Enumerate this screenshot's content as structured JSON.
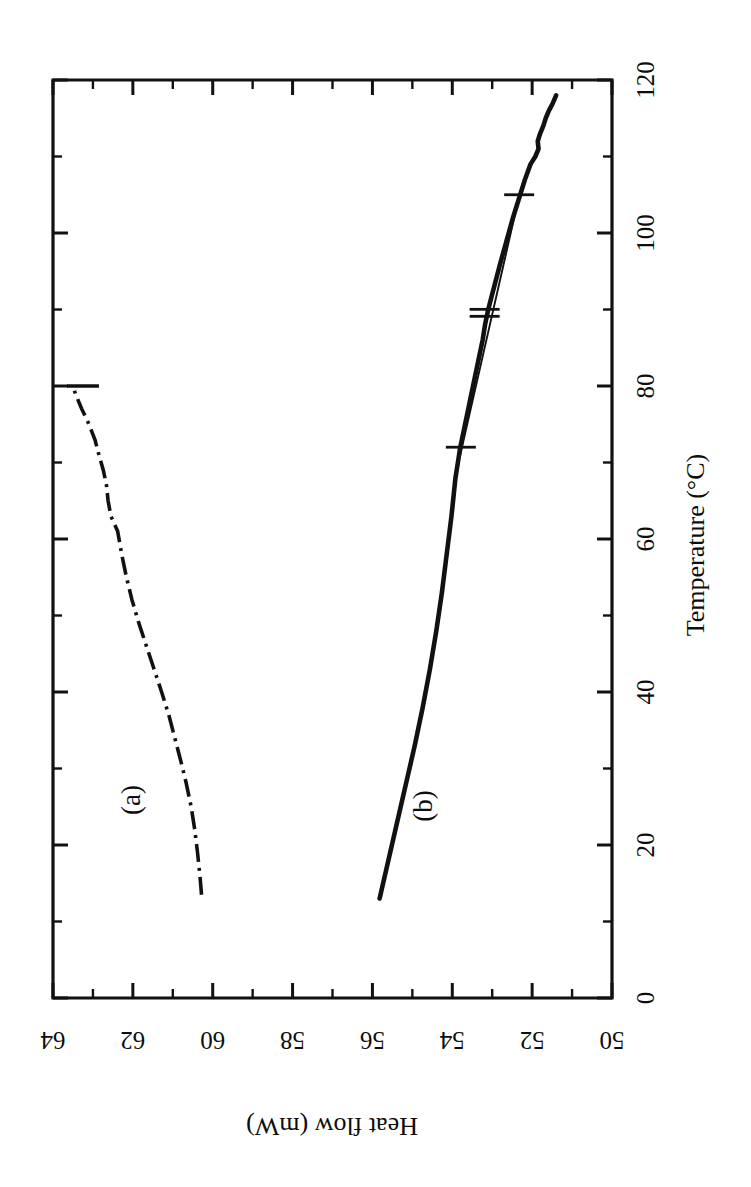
{
  "figure": {
    "kind": "dsc-thermogram",
    "orientation_note": "rotated",
    "background_color": "#ffffff",
    "ink_color": "#111111"
  },
  "chart_data": {
    "type": "line",
    "title": "",
    "subtitle": "",
    "xlabel": "Temperature (°C)",
    "ylabel": "Heat flow (mW)",
    "xlim": [
      0,
      120
    ],
    "ylim": [
      50,
      64
    ],
    "y_inverted": true,
    "grid": false,
    "legend": "inline-labels",
    "x_ticks": [
      0,
      20,
      40,
      60,
      80,
      100,
      120
    ],
    "x_tick_labels": [
      "0",
      "20",
      "40",
      "60",
      "80",
      "100",
      "120"
    ],
    "x_minor_step": 10,
    "y_ticks": [
      64,
      62,
      60,
      58,
      56,
      54,
      52,
      50
    ],
    "y_tick_labels": [
      "64",
      "62",
      "60",
      "58",
      "56",
      "54",
      "52",
      "50"
    ],
    "y_minor_step": 1,
    "annotations": [
      {
        "text": "(a)",
        "x": 24.0,
        "y": 61.8
      },
      {
        "text": "(b)",
        "x": 23.5,
        "y": 54.4
      }
    ],
    "series": [
      {
        "name": "(a)",
        "label": "(a)",
        "style": "dash-dot",
        "x": [
          13.5,
          16,
          19,
          22,
          25,
          28,
          31,
          34,
          37,
          40,
          43,
          46,
          49,
          52,
          55,
          58,
          61,
          63,
          65,
          67,
          69,
          71,
          73,
          75,
          77,
          79,
          80
        ],
        "y": [
          60.28,
          60.32,
          60.38,
          60.45,
          60.54,
          60.66,
          60.8,
          60.95,
          61.1,
          61.28,
          61.47,
          61.66,
          61.85,
          62.02,
          62.16,
          62.28,
          62.38,
          62.55,
          62.62,
          62.66,
          62.74,
          62.85,
          62.95,
          63.1,
          63.28,
          63.44,
          63.5
        ]
      },
      {
        "name": "(b)",
        "label": "(b)",
        "style": "solid",
        "x": [
          13.0,
          18,
          23,
          28,
          33,
          38,
          43,
          48,
          53,
          58,
          63,
          66,
          68,
          70,
          72,
          74,
          76,
          78,
          80,
          83,
          86,
          88,
          90,
          92,
          94,
          96,
          99,
          102,
          105,
          107,
          109,
          110,
          111,
          112,
          113,
          114,
          115,
          116,
          117,
          118
        ],
        "y": [
          55.82,
          55.6,
          55.38,
          55.16,
          54.94,
          54.74,
          54.56,
          54.4,
          54.26,
          54.14,
          54.02,
          53.96,
          53.92,
          53.86,
          53.8,
          53.72,
          53.64,
          53.56,
          53.48,
          53.36,
          53.24,
          53.18,
          53.1,
          53.0,
          52.9,
          52.8,
          52.64,
          52.48,
          52.3,
          52.18,
          52.04,
          51.92,
          51.84,
          51.86,
          51.8,
          51.72,
          51.66,
          51.58,
          51.48,
          51.4
        ]
      }
    ],
    "construction_lines": [
      {
        "name": "baseline-chord",
        "style": "thin-solid",
        "from": {
          "x": 71.0,
          "y": 53.8
        },
        "to": {
          "x": 104.5,
          "y": 52.34
        }
      }
    ],
    "markers": [
      {
        "name": "onset-marker",
        "x": 72.0,
        "y": 53.76,
        "style": "cross"
      },
      {
        "name": "mid-marker",
        "x": 89.5,
        "y": 53.14,
        "style": "double-cross"
      },
      {
        "name": "end-marker",
        "x": 105.0,
        "y": 52.3,
        "style": "cross"
      }
    ]
  },
  "axes": {
    "x_axis": {
      "name": "temperature-axis",
      "title": "Temperature (°C)",
      "labels": [
        "0",
        "20",
        "40",
        "60",
        "80",
        "100",
        "120"
      ]
    },
    "y_axis": {
      "name": "heat-flow-axis",
      "title": "Heat flow (mW)",
      "labels": [
        "64",
        "62",
        "60",
        "58",
        "56",
        "54",
        "52",
        "50"
      ]
    }
  },
  "labels": {
    "curve_a": "(a)",
    "curve_b": "(b)",
    "temperature_axis_title": "Temperature (°C)",
    "heat_flow_axis_title": "Heat flow (mW)"
  }
}
